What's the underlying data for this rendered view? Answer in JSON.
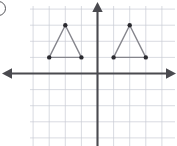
{
  "question_choice": {
    "marker_label": "",
    "marker_shape": "circle-outline"
  },
  "figure": {
    "title": ""
  },
  "chart_data": {
    "type": "scatter",
    "title": "",
    "xlabel": "",
    "ylabel": "",
    "xlim": [
      -4,
      5
    ],
    "ylim": [
      -4,
      4
    ],
    "grid": true,
    "grid_step": 1,
    "legend": "none",
    "axes": {
      "x_axis_visible": true,
      "y_axis_visible": true,
      "x_axis_arrows": [
        "left",
        "right"
      ],
      "y_axis_arrows": [
        "up"
      ],
      "tick_labels": []
    },
    "series": [
      {
        "name": "Triangle ABC",
        "type": "polygon",
        "closed": true,
        "points": [
          {
            "x": -3,
            "y": 1
          },
          {
            "x": -2,
            "y": 3
          },
          {
            "x": -1,
            "y": 1
          }
        ],
        "edge_color": "#85858c",
        "vertex_color": "#2b2b30"
      },
      {
        "name": "Triangle A'B'C'",
        "type": "polygon",
        "closed": true,
        "points": [
          {
            "x": 1,
            "y": 1
          },
          {
            "x": 2,
            "y": 3
          },
          {
            "x": 3,
            "y": 1
          }
        ],
        "edge_color": "#85858c",
        "vertex_color": "#2b2b30"
      }
    ]
  },
  "render": {
    "origin_px": {
      "x": 97.5,
      "y": 73.5
    },
    "unit_px": 16.1,
    "grid_bounds_px": {
      "left": 30,
      "top": 6,
      "right": 175,
      "bottom": 146
    },
    "colors": {
      "background": "#ffffff",
      "grid": "#c9ccd4",
      "axis": "#4a4a4f",
      "polygon_edge": "#85858c",
      "vertex": "#2b2b30",
      "marker_outline": "#55555a"
    }
  }
}
